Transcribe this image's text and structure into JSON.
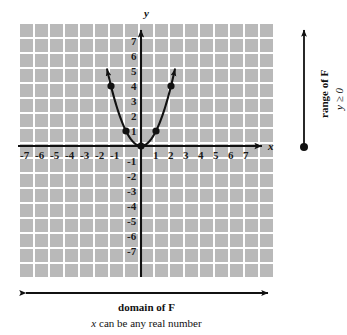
{
  "figure": {
    "title_text": "",
    "background_color": "#ffffff",
    "grid_fill_color": "#b9b9b9",
    "grid_line_color": "#ffffff",
    "axis_color": "#111111",
    "curve_color": "#111111"
  },
  "axes": {
    "x_axis_label": "x",
    "y_axis_label": "y",
    "x_ticks": [
      "-7",
      "-6",
      "-5",
      "-4",
      "-3",
      "-2",
      "-1",
      "1",
      "2",
      "3",
      "4",
      "5",
      "6",
      "7"
    ],
    "y_ticks_positive": [
      "1",
      "2",
      "3",
      "4",
      "5",
      "6",
      "7"
    ],
    "y_ticks_negative": [
      "-1",
      "-2",
      "-3",
      "-4",
      "-5",
      "-6",
      "-7"
    ]
  },
  "annotations": {
    "range_label": "range of F",
    "range_condition": "y ≥ 0",
    "domain_label": "domain of F",
    "domain_condition_prefix": "x",
    "domain_condition_rest": " can be any real number"
  },
  "chart_data": {
    "type": "line",
    "title": "",
    "xlabel": "x",
    "ylabel": "y",
    "xlim": [
      -7.5,
      7.5
    ],
    "ylim": [
      -7.5,
      7.5
    ],
    "grid": true,
    "legend": "none",
    "function": "y = x^2",
    "series": [
      {
        "name": "F(x) = x^2",
        "x": [
          -2.2,
          -2,
          -1.5,
          -1,
          -0.5,
          0,
          0.5,
          1,
          1.5,
          2,
          2.2
        ],
        "y": [
          4.84,
          4,
          2.25,
          1,
          0.25,
          0,
          0.25,
          1,
          2.25,
          4,
          4.84
        ]
      }
    ],
    "marked_points": [
      {
        "x": -2,
        "y": 4
      },
      {
        "x": -1,
        "y": 1
      },
      {
        "x": 0,
        "y": 0
      },
      {
        "x": 1,
        "y": 1
      },
      {
        "x": 2,
        "y": 4
      }
    ],
    "arrow_ends": [
      "up-left",
      "up-right"
    ],
    "annotations": [
      {
        "text": "range of F",
        "orientation": "vertical",
        "position": "right"
      },
      {
        "text": "y ≥ 0",
        "orientation": "vertical",
        "position": "right"
      },
      {
        "text": "domain of F",
        "orientation": "horizontal",
        "position": "bottom"
      },
      {
        "text": "x can be any real number",
        "orientation": "horizontal",
        "position": "bottom"
      }
    ]
  }
}
